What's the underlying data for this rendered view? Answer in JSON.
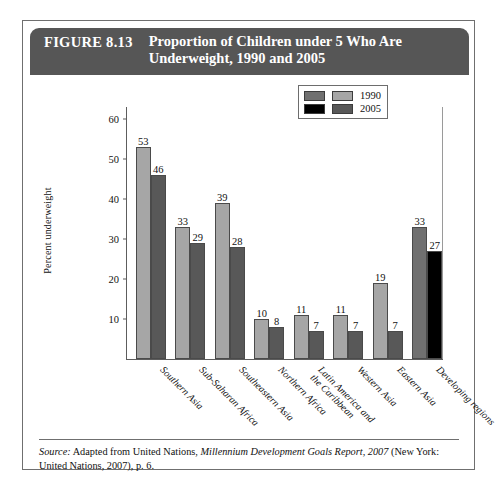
{
  "figure": {
    "number": "FIGURE 8.13",
    "title": "Proportion of Children under 5 Who Are Underweight,\n1990 and 2005"
  },
  "source_note": {
    "label": "Source:",
    "text_before": " Adapted from United Nations, ",
    "italic_title": "Millennium Development Goals Report, 2007",
    "text_after": " (New York: United Nations, 2007), p. 6."
  },
  "legend": {
    "entries": [
      {
        "label": "1990",
        "color": "#a6a6a6",
        "alt_color": "#707070"
      },
      {
        "label": "2005",
        "color": "#585858",
        "alt_color": "#000000"
      }
    ]
  },
  "chart_data": {
    "type": "bar",
    "title": "Proportion of Children under 5 Who Are Underweight, 1990 and 2005",
    "xlabel": "",
    "ylabel": "Percent underweight",
    "ylim": [
      0,
      63
    ],
    "yticks": [
      10,
      20,
      30,
      40,
      50,
      60
    ],
    "grid": false,
    "legend_position": "top-right",
    "categories": [
      "Southern Asia",
      "Sub-Saharan Africa",
      "Southeastern Asia",
      "Northern Africa",
      "Latin America and\nthe Caribbean",
      "Western Asia",
      "Eastern Asia",
      "Developing regions"
    ],
    "series": [
      {
        "name": "1990",
        "values": [
          53,
          33,
          39,
          10,
          11,
          11,
          19,
          33
        ]
      },
      {
        "name": "2005",
        "values": [
          46,
          29,
          28,
          8,
          7,
          7,
          7,
          27
        ]
      }
    ],
    "highlight_category_index": 7
  }
}
